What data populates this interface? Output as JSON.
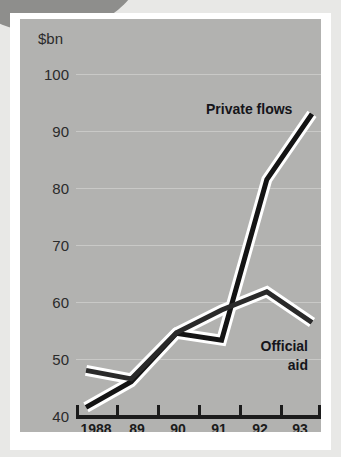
{
  "chart_data": {
    "type": "line",
    "title": "",
    "subtitle": "",
    "xlabel": "",
    "ylabel": "$bn",
    "unit_label": "$bn",
    "categories": [
      "1988",
      "89",
      "90",
      "91",
      "92",
      "93"
    ],
    "x": [
      1988,
      1989,
      1990,
      1991,
      1992,
      1993
    ],
    "ytick_labels": [
      "100",
      "90",
      "80",
      "70",
      "60",
      "50",
      "40"
    ],
    "ytick_values": [
      100,
      90,
      80,
      70,
      60,
      50,
      40
    ],
    "ylim": [
      40,
      100
    ],
    "grid": "horizontal",
    "legend_position": "inline-annotations",
    "series": [
      {
        "name": "Private flows",
        "label": "Private flows",
        "color": "#141414",
        "outline_color": "#ffffff",
        "values": [
          41.5,
          46.0,
          54.5,
          53.3,
          81.5,
          93.0
        ]
      },
      {
        "name": "Official aid",
        "label": "Official aid",
        "label_line1": "Official",
        "label_line2": "aid",
        "color": "#2a2a2a",
        "outline_color": "#ffffff",
        "values": [
          48.0,
          46.5,
          54.6,
          58.6,
          61.8,
          56.4
        ]
      }
    ],
    "annotations": [
      {
        "text": "Private flows",
        "series": "Private flows"
      },
      {
        "text": "Official aid",
        "series": "Official aid"
      }
    ],
    "colors": {
      "plot_background": "#b2b2b0",
      "card_background": "#ffffff",
      "page_background": "#e8e8e6",
      "gridline": "#c9c9c7",
      "axis": "#1b1b1b",
      "text": "#2b2b2b"
    }
  }
}
